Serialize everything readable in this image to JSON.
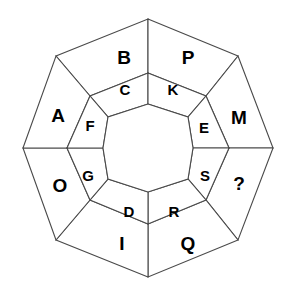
{
  "figure": {
    "stroke_color": "#4a4a4a",
    "fill_color": "#ffffff",
    "label_color": "#000000",
    "geometry": {
      "type": "nested-polygon-ring-diagram",
      "outer_ring_sides": 8,
      "inner_ring_cells": 10,
      "center_hole_sides": 10,
      "center_hole_label": ""
    },
    "outer_ring": {
      "name": "outer-octagon-ring",
      "cells": [
        {
          "label": "B",
          "position": "top-left",
          "cx": 124,
          "cy": 57
        },
        {
          "label": "P",
          "position": "top-right",
          "cx": 188,
          "cy": 57
        },
        {
          "label": "M",
          "position": "right-upper",
          "cx": 239,
          "cy": 117
        },
        {
          "label": "?",
          "position": "right-lower",
          "cx": 239,
          "cy": 183
        },
        {
          "label": "Q",
          "position": "bottom-right",
          "cx": 188,
          "cy": 243
        },
        {
          "label": "I",
          "position": "bottom-left",
          "cx": 122,
          "cy": 243
        },
        {
          "label": "O",
          "position": "left-lower",
          "cx": 60,
          "cy": 185
        },
        {
          "label": "A",
          "position": "left-upper",
          "cx": 58,
          "cy": 115
        }
      ]
    },
    "inner_ring": {
      "name": "inner-decagon-ring",
      "cells": [
        {
          "label": "C",
          "position": "top-left",
          "cx": 125,
          "cy": 89
        },
        {
          "label": "K",
          "position": "top-right",
          "cx": 173,
          "cy": 89
        },
        {
          "label": "E",
          "position": "right-upper",
          "cx": 204,
          "cy": 127
        },
        {
          "label": "S",
          "position": "right-lower",
          "cx": 205,
          "cy": 175
        },
        {
          "label": "R",
          "position": "bottom-right",
          "cx": 174,
          "cy": 211
        },
        {
          "label": "D",
          "position": "bottom-left",
          "cx": 129,
          "cy": 211
        },
        {
          "label": "G",
          "position": "left-lower",
          "cx": 88,
          "cy": 175
        },
        {
          "label": "F",
          "position": "left-upper",
          "cx": 90,
          "cy": 125
        }
      ]
    },
    "letter_sequence": [
      "A",
      "B",
      "C",
      "D",
      "E",
      "F",
      "G",
      "I",
      "K",
      "M",
      "O",
      "P",
      "Q",
      "R",
      "S",
      "?"
    ]
  }
}
